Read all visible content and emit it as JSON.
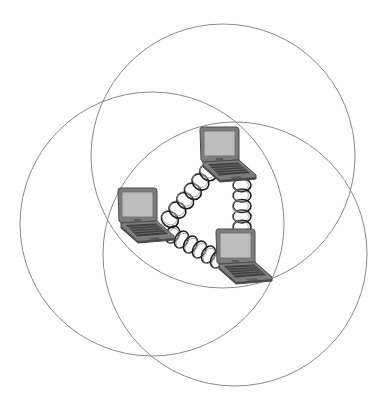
{
  "diagram": {
    "title": "",
    "colors": {
      "background": "#ffffff",
      "circle_stroke": "#8a8a8a",
      "laptop_body": "#7d7d7d",
      "laptop_dark": "#4a4a4a",
      "laptop_screen": "#bdbdbd",
      "keyboard": "#3c3c3c",
      "coil": "#1e1e1e"
    },
    "coverage_circles": [
      {
        "id": "top",
        "cx": 223,
        "cy": 156,
        "r": 132
      },
      {
        "id": "left",
        "cx": 152,
        "cy": 224,
        "r": 132
      },
      {
        "id": "right",
        "cx": 235,
        "cy": 254,
        "r": 132
      }
    ],
    "nodes": [
      {
        "id": "laptop-top",
        "x": 200,
        "y": 127,
        "icon": "laptop-icon"
      },
      {
        "id": "laptop-left",
        "x": 118,
        "y": 188,
        "icon": "laptop-icon"
      },
      {
        "id": "laptop-right",
        "x": 216,
        "y": 229,
        "icon": "laptop-icon"
      }
    ],
    "links": [
      {
        "id": "link-left-top",
        "from": "laptop-left",
        "to": "laptop-top",
        "x1": 166,
        "y1": 224,
        "x2": 212,
        "y2": 168,
        "turns": 6
      },
      {
        "id": "link-top-right",
        "from": "laptop-top",
        "to": "laptop-right",
        "x1": 242,
        "y1": 180,
        "x2": 242,
        "y2": 232,
        "turns": 5
      },
      {
        "id": "link-left-right",
        "from": "laptop-left",
        "to": "laptop-right",
        "x1": 168,
        "y1": 232,
        "x2": 222,
        "y2": 262,
        "turns": 6
      }
    ]
  }
}
